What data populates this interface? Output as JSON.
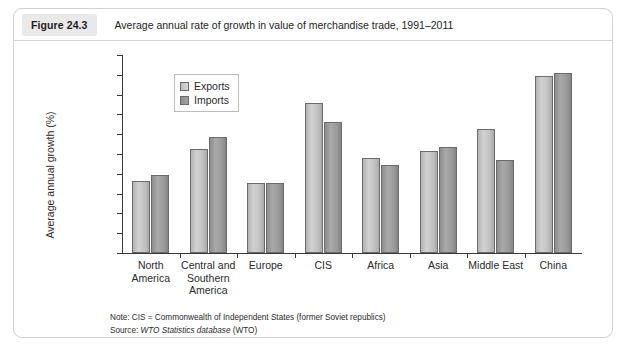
{
  "figure": {
    "badge": "Figure 24.3",
    "title": "Average annual rate of growth in value of merchandise trade, 1991–2011",
    "note_prefix": "Note: ",
    "note_text": "CIS = Commonwealth of Independent States (former Soviet republics)",
    "source_prefix": "Source: ",
    "source_italic": "WTO Statistics database",
    "source_suffix": " (WTO)"
  },
  "colors": {
    "exports": "#c8c8c8",
    "imports": "#999999",
    "axis": "#3a3a3a",
    "card_border": "#d2d2d2",
    "badge_bg": "#e9e9e9"
  },
  "chart_data": {
    "type": "bar",
    "title": "Average annual rate of growth in value of merchandise trade, 1991–2011",
    "xlabel": "",
    "ylabel": "Average annual growth (%)",
    "ylim": [
      0,
      20
    ],
    "yticks": [
      0,
      2,
      4,
      6,
      8,
      10,
      12,
      14,
      16,
      18,
      20
    ],
    "ytick_labels": [
      "0",
      "2",
      "4",
      "6",
      "8",
      "10",
      "12",
      "14",
      "16",
      "18",
      "20"
    ],
    "grid": false,
    "legend_position": "upper-left-inset",
    "categories": [
      "North America",
      "Central and Southern America",
      "Europe",
      "CIS",
      "Africa",
      "Asia",
      "Middle East",
      "China"
    ],
    "category_lines": [
      [
        "North",
        "America"
      ],
      [
        "Central and",
        "Southern",
        "America"
      ],
      [
        "Europe"
      ],
      [
        "CIS"
      ],
      [
        "Africa"
      ],
      [
        "Asia"
      ],
      [
        "Middle East"
      ],
      [
        "China"
      ]
    ],
    "series": [
      {
        "name": "Exports",
        "values": [
          7.3,
          10.5,
          7.1,
          15.2,
          9.6,
          10.3,
          12.5,
          17.9
        ]
      },
      {
        "name": "Imports",
        "values": [
          7.9,
          11.7,
          7.1,
          13.2,
          8.9,
          10.7,
          9.4,
          18.2
        ]
      }
    ]
  }
}
